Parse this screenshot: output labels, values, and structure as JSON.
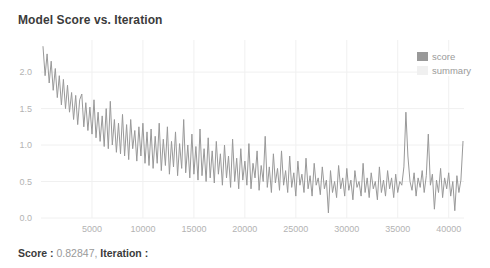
{
  "title": "Model Score vs. Iteration",
  "legend": {
    "items": [
      {
        "label": "score",
        "color": "#999999"
      },
      {
        "label": "summary",
        "color": "#f0f0f0"
      }
    ]
  },
  "status": {
    "score_label": "Score : ",
    "score_value": "0.82847, ",
    "iteration_label": "Iteration : ",
    "iteration_value": ""
  },
  "colors": {
    "title_text": "#3b3b3b",
    "tick_text": "#b3b3b3",
    "gridline": "#f0f0f0",
    "score_line": "#999999",
    "summary_swatch": "#f0f0f0",
    "background": "#ffffff"
  },
  "chart_data": {
    "type": "line",
    "title": "Model Score vs. Iteration",
    "xlabel": "",
    "ylabel": "",
    "xlim": [
      0,
      41500
    ],
    "ylim": [
      0,
      2.44
    ],
    "grid": true,
    "legend_position": "top-right",
    "x_ticks": [
      5000,
      10000,
      15000,
      20000,
      25000,
      30000,
      35000,
      40000
    ],
    "x_tick_labels": [
      "5000",
      "10000",
      "15000",
      "20000",
      "25000",
      "30000",
      "35000",
      "40000"
    ],
    "y_ticks": [
      0,
      0.5,
      1,
      1.5,
      2
    ],
    "y_tick_labels": [
      "0.0",
      "0.5",
      "1.0",
      "1.5",
      "2.0"
    ],
    "series": [
      {
        "name": "score",
        "color": "#999999",
        "x_start": 200,
        "x_step": 200,
        "values": [
          2.35,
          1.95,
          2.25,
          1.85,
          2.15,
          1.75,
          2.05,
          1.65,
          1.95,
          1.55,
          1.9,
          1.5,
          1.82,
          1.45,
          1.72,
          1.35,
          1.68,
          1.28,
          1.62,
          1.7,
          1.25,
          1.58,
          1.2,
          1.52,
          1.15,
          1.62,
          1.1,
          1.45,
          1.05,
          1.4,
          0.98,
          1.5,
          0.95,
          1.6,
          1.0,
          1.35,
          0.9,
          1.3,
          0.88,
          1.42,
          0.85,
          1.28,
          0.8,
          1.35,
          0.95,
          1.2,
          0.78,
          1.25,
          0.85,
          1.3,
          0.75,
          1.18,
          0.72,
          1.22,
          0.68,
          1.12,
          0.75,
          1.3,
          0.65,
          1.08,
          0.72,
          1.25,
          0.6,
          1.05,
          0.7,
          1.18,
          0.58,
          1.02,
          0.68,
          1.35,
          0.62,
          1.0,
          0.55,
          1.15,
          0.6,
          0.98,
          0.52,
          1.22,
          0.58,
          0.95,
          0.5,
          1.1,
          0.55,
          0.92,
          0.48,
          1.05,
          0.6,
          0.88,
          0.45,
          1.0,
          0.55,
          0.85,
          0.42,
          1.08,
          0.5,
          0.82,
          0.4,
          0.95,
          0.52,
          0.78,
          0.45,
          1.02,
          0.4,
          0.75,
          0.55,
          0.92,
          0.38,
          0.72,
          0.5,
          1.12,
          0.42,
          0.7,
          0.35,
          0.88,
          0.48,
          0.68,
          0.38,
          0.92,
          0.45,
          0.65,
          0.35,
          0.85,
          0.42,
          0.62,
          0.3,
          0.78,
          0.45,
          0.6,
          0.35,
          0.82,
          0.4,
          0.58,
          0.3,
          0.75,
          0.45,
          0.55,
          0.32,
          0.7,
          0.4,
          0.52,
          0.07,
          0.65,
          0.35,
          0.5,
          0.28,
          0.72,
          0.4,
          0.55,
          0.3,
          0.68,
          0.38,
          0.52,
          0.25,
          0.65,
          0.42,
          0.5,
          0.3,
          0.75,
          0.35,
          0.55,
          0.28,
          0.62,
          0.4,
          0.5,
          0.25,
          0.7,
          0.35,
          0.52,
          0.3,
          0.65,
          0.4,
          0.55,
          0.28,
          0.6,
          0.35,
          0.5,
          0.45,
          0.7,
          1.45,
          0.85,
          0.5,
          0.38,
          0.62,
          0.3,
          0.55,
          0.42,
          0.65,
          0.35,
          0.58,
          1.15,
          0.45,
          0.6,
          0.12,
          0.52,
          0.35,
          0.68,
          0.28,
          0.55,
          0.4,
          0.62,
          0.3,
          0.5,
          0.1,
          0.58,
          0.35,
          0.52,
          1.05
        ]
      },
      {
        "name": "summary",
        "color": "#f0f0f0",
        "values": []
      }
    ]
  }
}
